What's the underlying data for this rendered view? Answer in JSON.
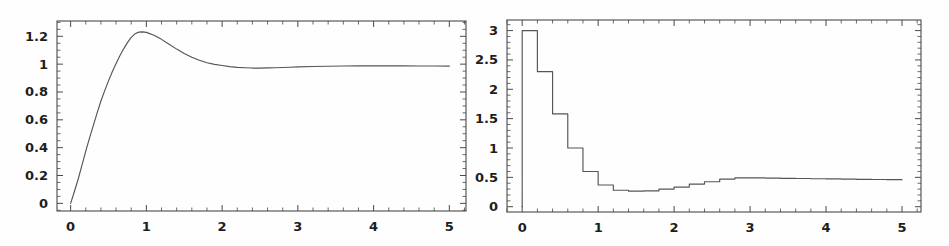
{
  "figure": {
    "background_color": "#fefefe",
    "axis_color": "#4a4a4a",
    "curve_color": "#555555",
    "label_color": "#1d1d1d",
    "panel_count": 2
  },
  "chart_data": [
    {
      "id": "left-plot",
      "type": "line",
      "title": "",
      "subtitle": "",
      "xlabel": "",
      "ylabel": "",
      "xlim": [
        -0.18,
        5.22
      ],
      "ylim": [
        -0.055,
        1.31
      ],
      "grid": false,
      "legend": "none",
      "annotations": [],
      "xticks": [
        0,
        1,
        2,
        3,
        4,
        5
      ],
      "xticklabels": [
        "0",
        "1",
        "2",
        "3",
        "4",
        "5"
      ],
      "xminor_step": 0.2,
      "yticks": [
        0,
        0.2,
        0.4,
        0.6,
        0.8,
        1,
        1.2
      ],
      "yticklabels": [
        "0",
        "0.2",
        "0.4",
        "0.6",
        "0.8",
        "1",
        "1.2"
      ],
      "yminor_step": 0.05,
      "series": [
        {
          "name": "step response",
          "x": [
            0.0,
            0.05,
            0.1,
            0.15,
            0.2,
            0.25,
            0.3,
            0.35,
            0.4,
            0.45,
            0.5,
            0.55,
            0.6,
            0.65,
            0.7,
            0.75,
            0.8,
            0.85,
            0.9,
            0.95,
            1.0,
            1.1,
            1.2,
            1.3,
            1.4,
            1.5,
            1.6,
            1.7,
            1.8,
            1.9,
            2.0,
            2.1,
            2.2,
            2.3,
            2.4,
            2.5,
            2.6,
            2.7,
            2.8,
            2.9,
            3.0,
            3.2,
            3.4,
            3.6,
            3.8,
            4.0,
            4.2,
            4.4,
            4.6,
            4.8,
            5.0
          ],
          "y": [
            0.0,
            0.085,
            0.175,
            0.275,
            0.375,
            0.47,
            0.56,
            0.65,
            0.735,
            0.81,
            0.88,
            0.945,
            1.005,
            1.06,
            1.11,
            1.155,
            1.192,
            1.218,
            1.23,
            1.232,
            1.228,
            1.208,
            1.178,
            1.143,
            1.108,
            1.077,
            1.05,
            1.028,
            1.01,
            0.998,
            0.99,
            0.982,
            0.977,
            0.974,
            0.972,
            0.972,
            0.973,
            0.974,
            0.976,
            0.978,
            0.98,
            0.983,
            0.985,
            0.987,
            0.988,
            0.988,
            0.988,
            0.988,
            0.987,
            0.987,
            0.986
          ]
        }
      ],
      "features": {
        "start_value": 0,
        "peak_x": 0.93,
        "peak_y": 1.23,
        "undershoot_x": 2.45,
        "undershoot_y": 0.972,
        "settling_value": 0.99,
        "final_value": 0.986
      }
    },
    {
      "id": "right-plot",
      "type": "line",
      "title": "",
      "subtitle": "",
      "xlabel": "",
      "ylabel": "",
      "xlim": [
        -0.2,
        5.25
      ],
      "ylim": [
        -0.09,
        3.18
      ],
      "grid": false,
      "legend": "none",
      "annotations": [],
      "xticks": [
        0,
        1,
        2,
        3,
        4,
        5
      ],
      "xticklabels": [
        "0",
        "1",
        "2",
        "3",
        "4",
        "5"
      ],
      "xminor_step": 0.2,
      "yticks": [
        0,
        0.5,
        1,
        1.5,
        2,
        2.5,
        3
      ],
      "yticklabels": [
        "0",
        "0.5",
        "1",
        "1.5",
        "2",
        "2.5",
        "3"
      ],
      "yminor_step": 0.1,
      "series": [
        {
          "name": "control effort (staircase)",
          "style": "step",
          "x": [
            0.0,
            0.2,
            0.4,
            0.6,
            0.8,
            1.0,
            1.2,
            1.4,
            1.6,
            1.8,
            2.0,
            2.2,
            2.4,
            2.6,
            2.8,
            3.0,
            3.2,
            3.4,
            3.6,
            3.8,
            4.0,
            4.2,
            4.4,
            4.6,
            4.8,
            5.0
          ],
          "y": [
            3.0,
            2.3,
            1.58,
            1.0,
            0.6,
            0.37,
            0.28,
            0.265,
            0.27,
            0.3,
            0.335,
            0.385,
            0.425,
            0.47,
            0.49,
            0.49,
            0.487,
            0.483,
            0.48,
            0.477,
            0.473,
            0.47,
            0.467,
            0.464,
            0.461,
            0.458
          ]
        }
      ],
      "features": {
        "riser_from": 0,
        "riser_to": 3.0,
        "max_value": 3.0,
        "min_value": 0.265,
        "min_x": 1.45,
        "final_value": 0.458
      }
    }
  ]
}
